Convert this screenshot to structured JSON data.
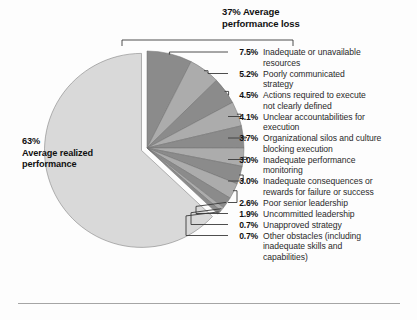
{
  "figure": {
    "background": "#fdfdfd",
    "rule_color": "#9a9a9a"
  },
  "bracket": {
    "heading_line1": "37% Average",
    "heading_line2": "performance loss"
  },
  "pie_label": {
    "line1": "63%",
    "line2": "Average realized",
    "line3": "performance"
  },
  "chart_data": {
    "type": "pie",
    "title": "37% Average performance loss",
    "xlabel": "",
    "ylabel": "",
    "units": "percent",
    "total": 100,
    "exploded_slice": "Average realized performance",
    "colors": {
      "realized": "#d9d9d9",
      "loss_dark": "#8b8b8b",
      "loss_light": "#acacac",
      "outline": "#6f6f6f"
    },
    "groups": [
      {
        "name": "Average realized performance",
        "value": 63.0
      },
      {
        "name": "Average performance loss",
        "value": 37.0
      }
    ],
    "categories": [
      "Average realized performance",
      "Inadequate or unavailable resources",
      "Poorly communicated strategy",
      "Actions required to execute not clearly defined",
      "Unclear accountabilities for execution",
      "Organizational silos and culture blocking execution",
      "Inadequate performance monitoring",
      "Inadequate consequences or rewards for failure or success",
      "Poor senior leadership",
      "Uncommitted leadership",
      "Unapproved strategy",
      "Other obstacles (including inadequate skills and capabilities)"
    ],
    "values": [
      63.0,
      7.5,
      5.2,
      4.5,
      4.1,
      3.7,
      3.0,
      3.0,
      2.6,
      1.9,
      0.7,
      0.7
    ]
  },
  "legend": {
    "rows": [
      {
        "pct": "7.5%",
        "lines": [
          "Inadequate or unavailable",
          "resources"
        ]
      },
      {
        "pct": "5.2%",
        "lines": [
          "Poorly communicated",
          "strategy"
        ]
      },
      {
        "pct": "4.5%",
        "lines": [
          "Actions required to execute",
          "not clearly defined"
        ]
      },
      {
        "pct": "4.1%",
        "lines": [
          "Unclear accountabilities for",
          "execution"
        ]
      },
      {
        "pct": "3.7%",
        "lines": [
          "Organizational silos and culture",
          "blocking execution"
        ]
      },
      {
        "pct": "3.0%",
        "lines": [
          "Inadequate performance",
          "monitoring"
        ]
      },
      {
        "pct": "3.0%",
        "lines": [
          "Inadequate consequences or",
          "rewards for failure or success"
        ]
      },
      {
        "pct": "2.6%",
        "lines": [
          "Poor senior leadership"
        ]
      },
      {
        "pct": "1.9%",
        "lines": [
          "Uncommitted leadership"
        ]
      },
      {
        "pct": "0.7%",
        "lines": [
          "Unapproved strategy"
        ]
      },
      {
        "pct": "0.7%",
        "lines": [
          "Other obstacles (including",
          "inadequate skills and",
          "capabilities)"
        ]
      }
    ]
  }
}
